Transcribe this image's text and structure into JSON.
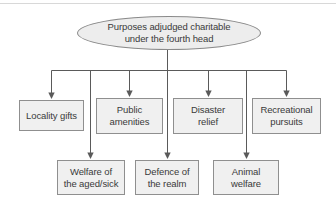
{
  "colors": {
    "box_fill": "#f0f0f0",
    "box_border": "#8f8f8f",
    "ellipse_fill": "#ededed",
    "line": "#5a5a5a",
    "text": "#3a3a3a",
    "top_rule": "#d8d8d8"
  },
  "diagram": {
    "root_label": "Purposes adjudged charitable\nunder the fourth head",
    "level1": [
      {
        "label": "Locality gifts"
      },
      {
        "label": "Public\namenities"
      },
      {
        "label": "Disaster\nrelief"
      },
      {
        "label": "Recreational\npursuits"
      }
    ],
    "level2": [
      {
        "label": "Welfare of\nthe aged/sick"
      },
      {
        "label": "Defence of\nthe realm"
      },
      {
        "label": "Animal\nwelfare"
      }
    ]
  }
}
